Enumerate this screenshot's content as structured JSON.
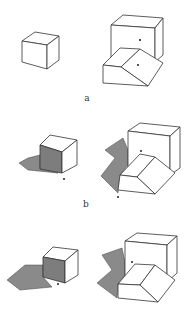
{
  "figure": {
    "panels": [
      {
        "label": "a",
        "left": "isolated cube without shading",
        "right": "large cube with wedge in front, two dots marked"
      },
      {
        "label": "b",
        "left": "cube with shaded front face and cast shadow, dot at corner",
        "right": "cube and wedge with cast shadow, two dots"
      },
      {
        "label": "",
        "left": "cube with shaded front face and cast shadow, dot at corner",
        "right": "cube and wedge with cast shadow, one dot"
      }
    ],
    "labels": {
      "a": "a",
      "b": "b"
    },
    "colors": {
      "line": "#333333",
      "shadow": "#8a8a8a",
      "face": "#ffffff"
    }
  }
}
